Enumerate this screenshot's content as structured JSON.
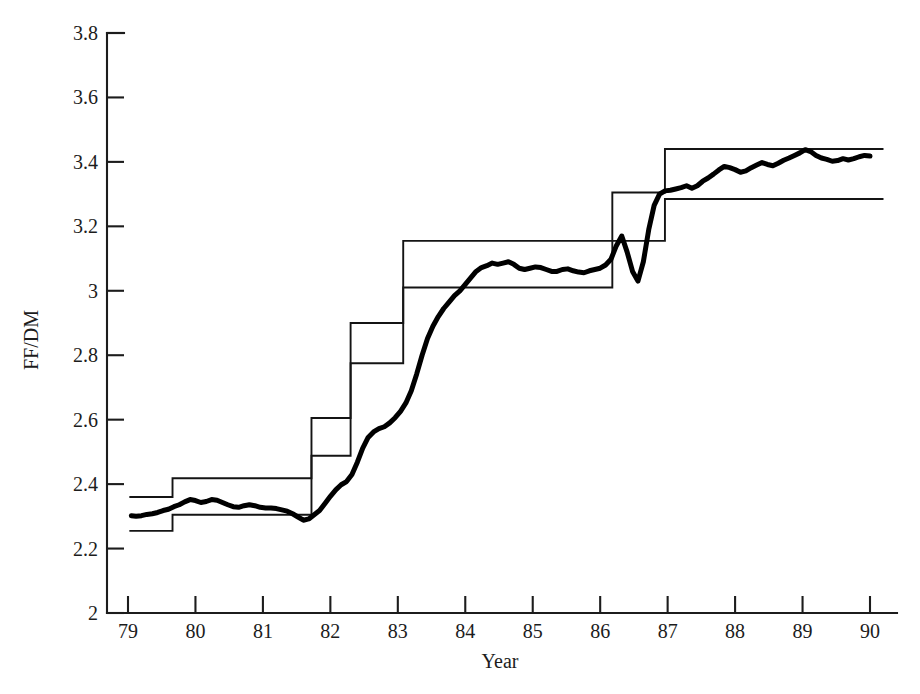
{
  "chart_data": {
    "type": "line",
    "title": "",
    "xlabel": "Year",
    "ylabel": "FF/DM",
    "xlim": [
      78.7,
      90.4
    ],
    "ylim": [
      2.0,
      3.8
    ],
    "grid": false,
    "legend": "none",
    "x_ticks": [
      "79",
      "80",
      "81",
      "82",
      "83",
      "84",
      "85",
      "86",
      "87",
      "88",
      "89",
      "90"
    ],
    "x_tick_values": [
      79,
      80,
      81,
      82,
      83,
      84,
      85,
      86,
      87,
      88,
      89,
      90
    ],
    "y_ticks": [
      "2",
      "2.2",
      "2.4",
      "2.6",
      "2.8",
      "3",
      "3.2",
      "3.4",
      "3.6",
      "3.8"
    ],
    "y_tick_values": [
      2,
      2.2,
      2.4,
      2.6,
      2.8,
      3,
      3.2,
      3.4,
      3.6,
      3.8
    ],
    "series": [
      {
        "name": "FF/DM exchange rate",
        "type": "line",
        "style": "thick-solid",
        "color": "#000000",
        "x": [
          79.05,
          79.12,
          79.2,
          79.28,
          79.36,
          79.44,
          79.52,
          79.6,
          79.68,
          79.76,
          79.84,
          79.92,
          80.0,
          80.08,
          80.16,
          80.24,
          80.32,
          80.4,
          80.48,
          80.56,
          80.64,
          80.72,
          80.8,
          80.88,
          80.96,
          81.04,
          81.12,
          81.2,
          81.28,
          81.36,
          81.44,
          81.52,
          81.6,
          81.68,
          81.76,
          81.84,
          81.92,
          82.0,
          82.08,
          82.16,
          82.24,
          82.32,
          82.4,
          82.48,
          82.56,
          82.64,
          82.72,
          82.8,
          82.88,
          82.96,
          83.04,
          83.12,
          83.2,
          83.28,
          83.36,
          83.44,
          83.52,
          83.6,
          83.68,
          83.76,
          83.84,
          83.92,
          84.0,
          84.08,
          84.16,
          84.24,
          84.32,
          84.4,
          84.48,
          84.56,
          84.64,
          84.72,
          84.8,
          84.88,
          84.96,
          85.04,
          85.12,
          85.2,
          85.28,
          85.36,
          85.44,
          85.52,
          85.6,
          85.68,
          85.76,
          85.84,
          85.92,
          86.0,
          86.08,
          86.16,
          86.24,
          86.32,
          86.4,
          86.48,
          86.56,
          86.64,
          86.72,
          86.8,
          86.88,
          86.96,
          87.04,
          87.12,
          87.2,
          87.28,
          87.36,
          87.44,
          87.52,
          87.6,
          87.68,
          87.76,
          87.84,
          87.92,
          88.0,
          88.08,
          88.16,
          88.24,
          88.32,
          88.4,
          88.48,
          88.56,
          88.64,
          88.72,
          88.8,
          88.88,
          88.96,
          89.04,
          89.12,
          89.2,
          89.28,
          89.36,
          89.44,
          89.52,
          89.6,
          89.68,
          89.76,
          89.84,
          89.92,
          90.0
        ],
        "y": [
          2.302,
          2.3,
          2.302,
          2.306,
          2.308,
          2.312,
          2.318,
          2.322,
          2.33,
          2.336,
          2.345,
          2.352,
          2.349,
          2.343,
          2.346,
          2.352,
          2.35,
          2.343,
          2.336,
          2.33,
          2.328,
          2.333,
          2.336,
          2.333,
          2.328,
          2.326,
          2.326,
          2.324,
          2.32,
          2.316,
          2.308,
          2.298,
          2.288,
          2.292,
          2.305,
          2.318,
          2.34,
          2.362,
          2.382,
          2.398,
          2.408,
          2.43,
          2.468,
          2.512,
          2.545,
          2.562,
          2.572,
          2.578,
          2.59,
          2.606,
          2.626,
          2.652,
          2.69,
          2.742,
          2.8,
          2.852,
          2.89,
          2.92,
          2.945,
          2.965,
          2.985,
          3.0,
          3.02,
          3.04,
          3.06,
          3.072,
          3.078,
          3.086,
          3.082,
          3.086,
          3.09,
          3.082,
          3.07,
          3.066,
          3.07,
          3.074,
          3.072,
          3.066,
          3.06,
          3.06,
          3.066,
          3.068,
          3.062,
          3.058,
          3.056,
          3.062,
          3.066,
          3.07,
          3.08,
          3.098,
          3.14,
          3.17,
          3.12,
          3.06,
          3.03,
          3.09,
          3.19,
          3.265,
          3.3,
          3.31,
          3.312,
          3.316,
          3.32,
          3.326,
          3.318,
          3.326,
          3.34,
          3.35,
          3.362,
          3.375,
          3.386,
          3.382,
          3.376,
          3.368,
          3.372,
          3.382,
          3.39,
          3.398,
          3.392,
          3.388,
          3.396,
          3.405,
          3.412,
          3.42,
          3.428,
          3.438,
          3.432,
          3.42,
          3.412,
          3.408,
          3.402,
          3.404,
          3.41,
          3.406,
          3.41,
          3.416,
          3.42,
          3.418
        ]
      },
      {
        "name": "Upper intervention limit",
        "type": "step",
        "style": "thin-solid",
        "color": "#141414",
        "steps": [
          {
            "x_start": 79.02,
            "x_end": 79.66,
            "y": 2.36
          },
          {
            "x_start": 79.66,
            "x_end": 81.72,
            "y": 2.418
          },
          {
            "x_start": 81.72,
            "x_end": 82.3,
            "y": 2.605
          },
          {
            "x_start": 82.3,
            "x_end": 83.08,
            "y": 2.9
          },
          {
            "x_start": 83.08,
            "x_end": 86.18,
            "y": 3.155
          },
          {
            "x_start": 86.18,
            "x_end": 86.96,
            "y": 3.305
          },
          {
            "x_start": 86.96,
            "x_end": 90.2,
            "y": 3.44
          }
        ]
      },
      {
        "name": "Lower intervention limit",
        "type": "step",
        "style": "thin-solid",
        "color": "#141414",
        "steps": [
          {
            "x_start": 79.02,
            "x_end": 79.66,
            "y": 2.255
          },
          {
            "x_start": 79.66,
            "x_end": 81.72,
            "y": 2.305
          },
          {
            "x_start": 81.72,
            "x_end": 82.3,
            "y": 2.488
          },
          {
            "x_start": 82.3,
            "x_end": 83.08,
            "y": 2.775
          },
          {
            "x_start": 83.08,
            "x_end": 86.18,
            "y": 3.01
          },
          {
            "x_start": 86.18,
            "x_end": 86.96,
            "y": 3.155
          },
          {
            "x_start": 86.96,
            "x_end": 90.2,
            "y": 3.285
          }
        ]
      }
    ],
    "annotations": []
  },
  "axes": {
    "y_label": "FF/DM",
    "x_label": "Year"
  }
}
